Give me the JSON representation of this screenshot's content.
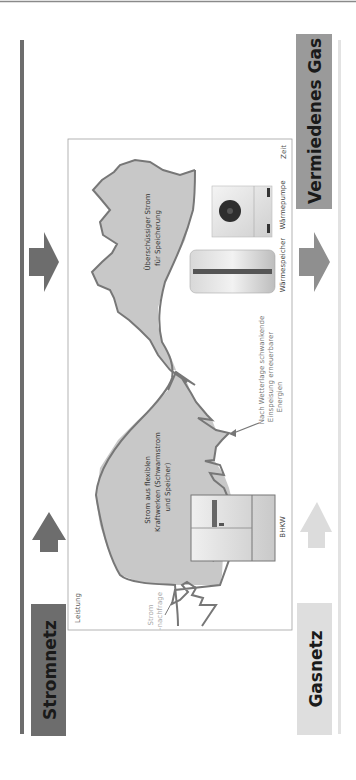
{
  "headings": {
    "stromnetz": "Stromnetz",
    "gasnetz": "Gasnetz",
    "vermiedenes_gas": "Vermiedenes Gas"
  },
  "chart": {
    "y_axis_label": "Leistung",
    "x_axis_label": "Zeit",
    "demand_label_1": "Strom",
    "demand_label_2": "-nachfrage",
    "flex_label": [
      "Strom aus flexiblen",
      "Kraftwerken (Schwarmstrom",
      "und Speicher)"
    ],
    "surplus_label": [
      "Überschüssiger Strom",
      "für Speicherung"
    ],
    "renewables_label": [
      "Nach Wetterlage schwankende",
      "Einspeisung erneuerbarer",
      "Energien"
    ]
  },
  "devices": {
    "bhkw": "BHKW",
    "waermespeicher": "Wärmespeicher",
    "waermepumpe": "Wärmepumpe"
  },
  "arrows": {
    "strom_left": "arrow-to-stromnetz",
    "strom_right": "arrow-from-surplus",
    "gas_left": "arrow-from-gasnetz",
    "gas_right": "arrow-to-vermiedenes-gas"
  },
  "colors": {
    "dark_bar": "#6d6d6d",
    "mid_bar": "#8f8f8f",
    "light_bar": "#dcdcdc",
    "fill_area": "#c4c4c4",
    "curve": "#777777",
    "frame": "#9a9a9a"
  }
}
